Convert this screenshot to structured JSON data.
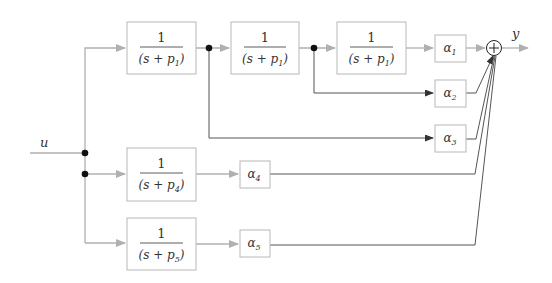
{
  "diagram": {
    "type": "block-diagram",
    "input_label": "u",
    "output_label": "y",
    "colors": {
      "block_border": "#b8b8b8",
      "gray_wire": "#b0b0b0",
      "dark_wire": "#555555",
      "dot": "#111111"
    },
    "blocks": [
      {
        "id": "b1",
        "numerator": "1",
        "denominator": "(s + p",
        "sub": "1",
        "close": ")"
      },
      {
        "id": "b2",
        "numerator": "1",
        "denominator": "(s + p",
        "sub": "1",
        "close": ")"
      },
      {
        "id": "b3",
        "numerator": "1",
        "denominator": "(s + p",
        "sub": "1",
        "close": ")"
      },
      {
        "id": "b4",
        "numerator": "1",
        "denominator": "(s + p",
        "sub": "4",
        "close": ")"
      },
      {
        "id": "b5",
        "numerator": "1",
        "denominator": "(s + p",
        "sub": "5",
        "close": ")"
      }
    ],
    "gains": [
      {
        "id": "a1",
        "symbol": "α",
        "sub": "1"
      },
      {
        "id": "a2",
        "symbol": "α",
        "sub": "2"
      },
      {
        "id": "a3",
        "symbol": "α",
        "sub": "3"
      },
      {
        "id": "a4",
        "symbol": "α",
        "sub": "4"
      },
      {
        "id": "a5",
        "symbol": "α",
        "sub": "5"
      }
    ],
    "summing_junction": {
      "symbol": "+"
    }
  }
}
